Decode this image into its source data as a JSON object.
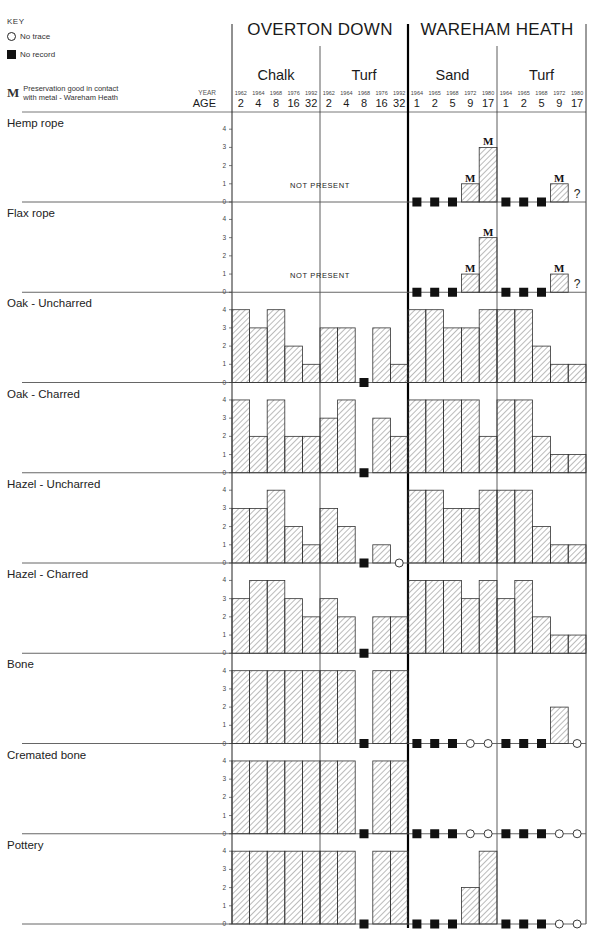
{
  "key": {
    "title": "KEY",
    "no_trace": "No trace",
    "no_record": "No record",
    "m_glyph": "M",
    "m_line1": "Preservation good in contact",
    "m_line2": "with metal - Wareham Heath"
  },
  "header": {
    "year_label": "YEAR",
    "age_label": "AGE",
    "sites": [
      {
        "name": "OVERTON DOWN",
        "soils": [
          {
            "name": "Chalk",
            "years": [
              "1962",
              "1964",
              "1968",
              "1976",
              "1992"
            ],
            "ages": [
              "2",
              "4",
              "8",
              "16",
              "32"
            ]
          },
          {
            "name": "Turf",
            "years": [
              "1962",
              "1964",
              "1968",
              "1976",
              "1992"
            ],
            "ages": [
              "2",
              "4",
              "8",
              "16",
              "32"
            ]
          }
        ]
      },
      {
        "name": "WAREHAM HEATH",
        "soils": [
          {
            "name": "Sand",
            "years": [
              "1964",
              "1965",
              "1968",
              "1972",
              "1980"
            ],
            "ages": [
              "1",
              "2",
              "5",
              "9",
              "17"
            ]
          },
          {
            "name": "Turf",
            "years": [
              "1964",
              "1965",
              "1968",
              "1972",
              "1980"
            ],
            "ages": [
              "1",
              "2",
              "5",
              "9",
              "17"
            ]
          }
        ]
      }
    ]
  },
  "axis_ticks": [
    "0",
    "1",
    "2",
    "3",
    "4"
  ],
  "not_present_label": "NOT   PRESENT",
  "chart_data": {
    "type": "bar",
    "xlabel": "Site / soil / year (age in years)",
    "ylabel": "Preservation score (0-4)",
    "ylim": [
      0,
      4
    ],
    "legend": {
      "NT": "No trace",
      "NR": "No record",
      "M": "Preservation good in contact with metal - Wareham Heath",
      "?": "uncertain"
    },
    "categories": [
      "OD Chalk 1962 (2)",
      "OD Chalk 1964 (4)",
      "OD Chalk 1968 (8)",
      "OD Chalk 1976 (16)",
      "OD Chalk 1992 (32)",
      "OD Turf 1962 (2)",
      "OD Turf 1964 (4)",
      "OD Turf 1968 (8)",
      "OD Turf 1976 (16)",
      "OD Turf 1992 (32)",
      "WH Sand 1964 (1)",
      "WH Sand 1965 (2)",
      "WH Sand 1968 (5)",
      "WH Sand 1972 (9)",
      "WH Sand 1980 (17)",
      "WH Turf 1964 (1)",
      "WH Turf 1965 (2)",
      "WH Turf 1968 (5)",
      "WH Turf 1972 (9)",
      "WH Turf 1980 (17)"
    ],
    "series": [
      {
        "name": "Hemp rope",
        "not_present_overton": true,
        "values": [
          null,
          null,
          null,
          null,
          null,
          null,
          null,
          null,
          null,
          null,
          "NR",
          "NR",
          "NR",
          1,
          3,
          "NR",
          "NR",
          "NR",
          1,
          "?"
        ],
        "marks": {
          "13": "M",
          "14": "M",
          "18": "M"
        }
      },
      {
        "name": "Flax rope",
        "not_present_overton": true,
        "values": [
          null,
          null,
          null,
          null,
          null,
          null,
          null,
          null,
          null,
          null,
          "NR",
          "NR",
          "NR",
          1,
          3,
          "NR",
          "NR",
          "NR",
          1,
          "?"
        ],
        "marks": {
          "13": "M",
          "14": "M",
          "18": "M"
        }
      },
      {
        "name": "Oak - Uncharred",
        "values": [
          4,
          3,
          4,
          2,
          1,
          3,
          3,
          "NR",
          3,
          1,
          4,
          4,
          3,
          3,
          4,
          4,
          4,
          2,
          1,
          1
        ]
      },
      {
        "name": "Oak - Charred",
        "values": [
          4,
          2,
          4,
          2,
          2,
          3,
          4,
          "NR",
          3,
          2,
          4,
          4,
          4,
          4,
          2,
          4,
          4,
          2,
          1,
          1
        ]
      },
      {
        "name": "Hazel - Uncharred",
        "values": [
          3,
          3,
          4,
          2,
          1,
          3,
          2,
          "NR",
          1,
          "NT",
          4,
          4,
          3,
          3,
          4,
          4,
          4,
          2,
          1,
          1
        ]
      },
      {
        "name": "Hazel - Charred",
        "values": [
          3,
          4,
          4,
          3,
          2,
          3,
          2,
          "NR",
          2,
          2,
          4,
          4,
          4,
          3,
          4,
          3,
          4,
          2,
          1,
          1
        ]
      },
      {
        "name": "Bone",
        "values": [
          4,
          4,
          4,
          4,
          4,
          4,
          4,
          "NR",
          4,
          4,
          "NR",
          "NR",
          "NR",
          "NT",
          "NT",
          "NR",
          "NR",
          "NR",
          2,
          "NT"
        ]
      },
      {
        "name": "Cremated bone",
        "values": [
          4,
          4,
          4,
          4,
          4,
          4,
          4,
          "NR",
          4,
          4,
          "NR",
          "NR",
          "NR",
          "NT",
          "NT",
          "NR",
          "NR",
          "NR",
          "NT",
          "NT"
        ]
      },
      {
        "name": "Pottery",
        "values": [
          4,
          4,
          4,
          4,
          4,
          4,
          4,
          "NR",
          4,
          4,
          "NR",
          "NR",
          "NR",
          2,
          4,
          "NR",
          "NR",
          "NR",
          "NT",
          "NT"
        ]
      }
    ]
  }
}
